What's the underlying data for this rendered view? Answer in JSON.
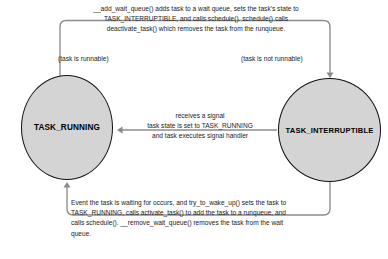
{
  "diagram": {
    "type": "state-transition-diagram",
    "colors": {
      "node_fill": "#d4d4d4",
      "node_stroke": "#111111",
      "edge_stroke": "#8c8c8c",
      "text": "#1a1a1a",
      "background": "#ffffff"
    },
    "nodes": [
      {
        "id": "task_running",
        "label": "TASK_RUNNING",
        "shape": "circle",
        "note": "(task is runnable)"
      },
      {
        "id": "task_interruptible",
        "label": "TASK_INTERRUPTIBLE",
        "shape": "circle",
        "note": "(task is not runnable)"
      }
    ],
    "edges": [
      {
        "id": "running-to-interruptible",
        "from": "task_running",
        "to": "task_interruptible",
        "direction": "top-loop",
        "label": "__add_wait_queue() adds task to a wait queue, sets the task's state to\nTASK_INTERRUPTIBLE,  and calls schedule().  schedule() calls\ndeactivate_task() which removes the task from the runqueue."
      },
      {
        "id": "interruptible-to-running-signal",
        "from": "task_interruptible",
        "to": "task_running",
        "direction": "middle-left",
        "label": "receives a signal\ntask state is set to TASK_RUNNING\nand task executes signal handler"
      },
      {
        "id": "interruptible-to-running-wakeup",
        "from": "task_interruptible",
        "to": "task_running",
        "direction": "bottom-loop",
        "label": "Event the task is waiting for occurs, and try_to_wake_up() sets the task to\nTASK_RUNNING, calls activate_task() to add the task to a runqueue, and\ncalls schedule().  __remove_wait_queue() removes the task from the wait\nqueue."
      }
    ]
  }
}
